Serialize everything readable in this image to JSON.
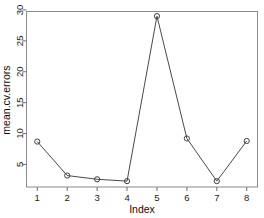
{
  "chart_data": {
    "type": "line",
    "title": "",
    "subtitle": "",
    "xlabel": "Index",
    "ylabel": "mean.cv.errors",
    "x": [
      1,
      2,
      3,
      4,
      5,
      6,
      7,
      8
    ],
    "values": [
      8.7,
      3.2,
      2.6,
      2.3,
      29.0,
      9.2,
      2.3,
      8.8
    ],
    "xticks": [
      1,
      2,
      3,
      4,
      5,
      6,
      7,
      8
    ],
    "xtick_labels": [
      "1",
      "2",
      "3",
      "4",
      "5",
      "6",
      "7",
      "8"
    ],
    "yticks": [
      5,
      10,
      15,
      20,
      25,
      30
    ],
    "ytick_labels": [
      "5",
      "10",
      "15",
      "20",
      "25",
      "30"
    ],
    "xlim": [
      0.64,
      8.36
    ],
    "ylim": [
      1.35,
      29.75
    ],
    "grid": false,
    "legend": null,
    "marker": "open-circle",
    "line_color": "#4a4a4a",
    "marker_color": "#3f3f3f",
    "background_color": "#ffffff",
    "border_color": "#8a8a8a",
    "text_color": "#1a1a1a"
  }
}
